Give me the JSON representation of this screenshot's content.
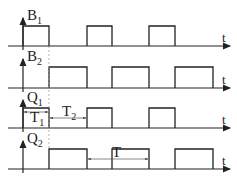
{
  "diagram": {
    "type": "timing-diagram",
    "time_axis_label": "t",
    "signals": [
      {
        "name": "B",
        "subscript": "1",
        "baseline_y": 46,
        "high_y": 26,
        "pulses": [
          [
            23,
            49
          ],
          [
            87,
            112
          ],
          [
            149,
            175
          ]
        ]
      },
      {
        "name": "B",
        "subscript": "2",
        "baseline_y": 88,
        "high_y": 67,
        "pulses": [
          [
            49,
            87
          ],
          [
            112,
            149
          ],
          [
            175,
            213
          ]
        ]
      },
      {
        "name": "Q",
        "subscript": "1",
        "baseline_y": 128,
        "high_y": 108,
        "pulses": [
          [
            23,
            49
          ],
          [
            87,
            112
          ],
          [
            149,
            175
          ]
        ]
      },
      {
        "name": "Q",
        "subscript": "2",
        "baseline_y": 169,
        "high_y": 149,
        "pulses": [
          [
            49,
            87
          ],
          [
            112,
            149
          ],
          [
            175,
            213
          ]
        ]
      }
    ],
    "annotations": [
      {
        "label": "T",
        "subscript": "1",
        "from_x": 23,
        "to_x": 49,
        "y": 112
      },
      {
        "label": "T",
        "subscript": "2",
        "from_x": 49,
        "to_x": 87,
        "y": 118
      },
      {
        "label": "T",
        "subscript": "",
        "from_x": 87,
        "to_x": 149,
        "y": 159
      }
    ],
    "colors": {
      "line": "#222222",
      "dashed": "#888888"
    }
  }
}
